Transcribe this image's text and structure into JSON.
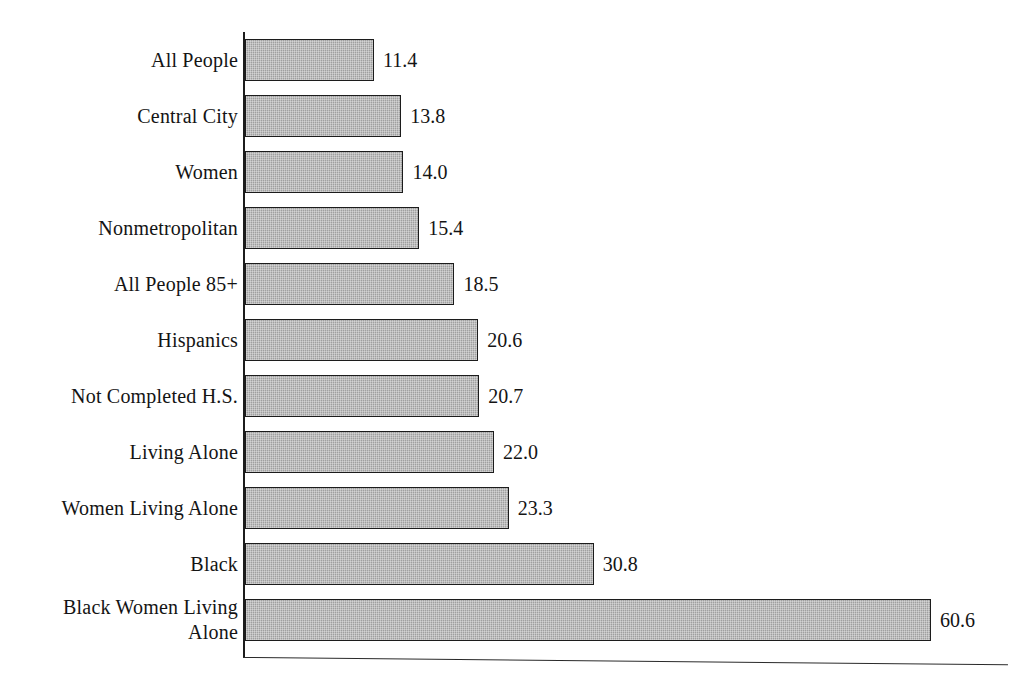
{
  "chart_data": {
    "type": "bar",
    "orientation": "horizontal",
    "title": "",
    "subtitle": "",
    "xlabel": "",
    "ylabel": "",
    "xlim": [
      0,
      68
    ],
    "grid": false,
    "legend": false,
    "bar_color": "#a9a9a9",
    "bar_border_color": "#1c1c1c",
    "axis_color": "#1c1c1c",
    "value_label_format": "one-decimal",
    "categories": [
      "All People",
      "Central City",
      "Women",
      "Nonmetropolitan",
      "All People 85+",
      "Hispanics",
      "Not Completed H.S.",
      "Living Alone",
      "Women Living Alone",
      "Black",
      "Black Women Living\nAlone"
    ],
    "values": [
      11.4,
      13.8,
      14.0,
      15.4,
      18.5,
      20.6,
      20.7,
      22.0,
      23.3,
      30.8,
      60.6
    ],
    "value_labels": [
      "11.4",
      "13.8",
      "14.0",
      "15.4",
      "18.5",
      "20.6",
      "20.7",
      "22.0",
      "23.3",
      "30.8",
      "60.6"
    ]
  }
}
